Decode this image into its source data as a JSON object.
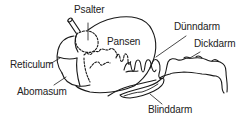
{
  "diagram": {
    "line_color": "#1a1a1a",
    "text_color": "#222222",
    "labels": {
      "psalter": "Psalter",
      "pansen": "Pansen",
      "duenndarm": "Dünndarm",
      "dickdarm": "Dickdarm",
      "reticulum": "Reticulum",
      "abomasum": "Abomasum",
      "blinddarm": "Blinddarm"
    }
  }
}
